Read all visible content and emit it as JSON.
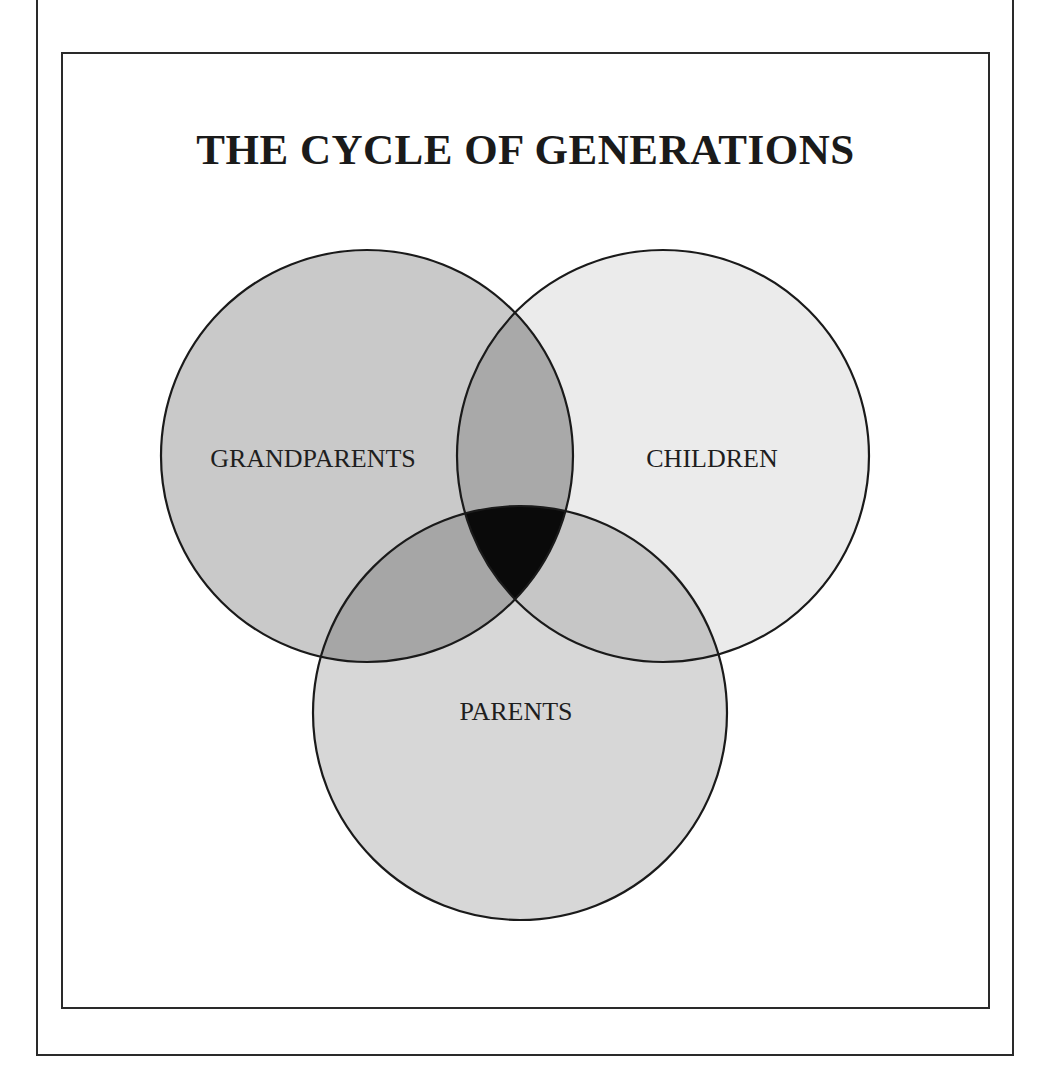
{
  "title": "THE CYCLE OF GENERATIONS",
  "diagram": {
    "type": "venn",
    "sets": [
      {
        "id": "grandparents",
        "label": "GRANDPARENTS",
        "cx": 367,
        "cy": 456,
        "r": 206,
        "fill": "#c9c9c9",
        "label_x": 313,
        "label_y": 467
      },
      {
        "id": "children",
        "label": "CHILDREN",
        "cx": 663,
        "cy": 456,
        "r": 206,
        "fill": "#ebebeb",
        "label_x": 712,
        "label_y": 467
      },
      {
        "id": "parents",
        "label": "PARENTS",
        "cx": 520,
        "cy": 713,
        "r": 207,
        "fill": "#d7d7d7",
        "label_x": 516,
        "label_y": 720
      }
    ],
    "intersections": {
      "grandparents_children": "#a9a9a9",
      "grandparents_parents": "#a6a6a6",
      "children_parents": "#c6c6c6",
      "all_three": "#0a0a0a"
    },
    "stroke": "#1a1a1a"
  }
}
